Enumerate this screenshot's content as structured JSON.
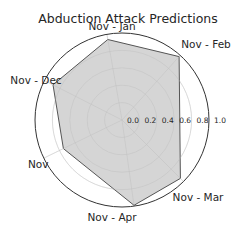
{
  "chart_data": {
    "type": "radar",
    "title": "Abduction Attack Predictions",
    "categories": [
      "Nov - Jan",
      "Nov - Feb",
      "Nov - Mar",
      "Nov - Apr",
      "Nov",
      "Nov - Dec"
    ],
    "angles_deg": [
      100,
      48,
      -45,
      -82,
      206,
      153
    ],
    "series": [
      {
        "name": "Predictions",
        "values": [
          0.94,
          0.98,
          0.95,
          0.99,
          0.75,
          0.89
        ]
      }
    ],
    "rlim": [
      0,
      1.0
    ],
    "radial_ticks": [
      "0.0",
      "0.2",
      "0.4",
      "0.6",
      "0.8",
      "1.0"
    ],
    "grid": true,
    "fill_color": "#d0d0d0",
    "edge_color": "#555555"
  }
}
